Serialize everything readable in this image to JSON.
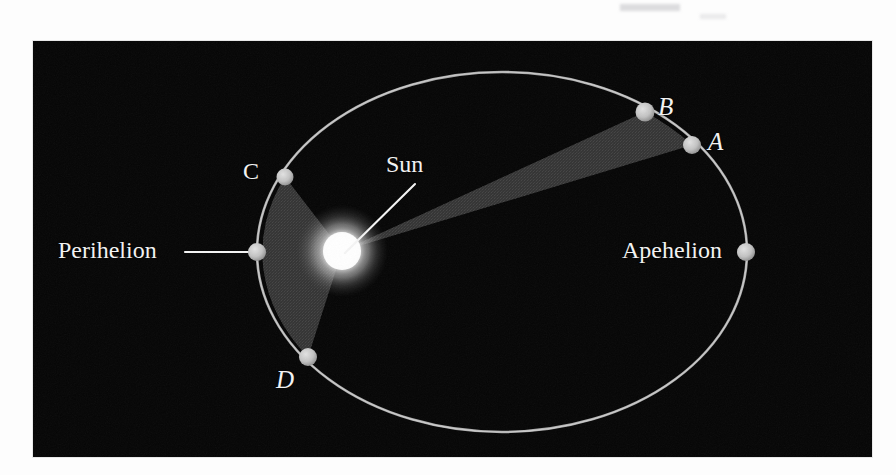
{
  "figure": {
    "title_alt": "Kepler's second law: equal areas swept in equal times",
    "background_color": "#ffffff",
    "plate_color": "#050505",
    "orbit_color": "#b9b9b9",
    "sector_color": "#3a3a3a",
    "marker_color": "#c9c9c9",
    "sun_color": "#ffffff",
    "label_color": "#f2f2f2"
  },
  "labels": {
    "sun": "Sun",
    "perihelion": "Perihelion",
    "apehelion": "Apehelion",
    "point_a": "A",
    "point_b": "B",
    "point_c": "C",
    "point_d": "D"
  },
  "geometry": {
    "ellipse": {
      "cx": 469,
      "cy": 211,
      "rx": 245,
      "ry": 180
    },
    "sun": {
      "cx": 309,
      "cy": 210,
      "r": 23
    },
    "markers": [
      {
        "name": "point-a",
        "cx": 659,
        "cy": 104
      },
      {
        "name": "point-b",
        "cx": 612,
        "cy": 71
      },
      {
        "name": "point-c",
        "cx": 252,
        "cy": 136
      },
      {
        "name": "point-d",
        "cx": 275,
        "cy": 316
      },
      {
        "name": "perihelion",
        "cx": 224,
        "cy": 211
      },
      {
        "name": "apehelion",
        "cx": 713,
        "cy": 211
      }
    ],
    "marker_radius": 9,
    "sectors": [
      {
        "name": "sector-ab",
        "description": "equal-area wedge swept between points A and B, far from the Sun"
      },
      {
        "name": "sector-cd",
        "description": "equal-area wedge swept between points C and D, near perihelion"
      }
    ]
  },
  "leader_lines": [
    {
      "name": "sun-leader",
      "from": "Sun label",
      "to": "Sun center"
    },
    {
      "name": "perihelion-leader",
      "from": "Perihelion label",
      "to": "perihelion marker"
    }
  ]
}
